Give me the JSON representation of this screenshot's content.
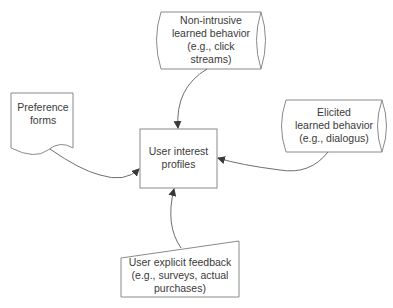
{
  "diagram": {
    "center": {
      "id": "user-interest-profiles",
      "shape": "rectangle",
      "lines": [
        "User interest",
        "profiles"
      ]
    },
    "sources": [
      {
        "id": "non-intrusive",
        "shape": "stored-data-cylinder",
        "lines": [
          "Non-intrusive",
          "learned behavior",
          "(e.g., click",
          "streams)"
        ],
        "position": "top"
      },
      {
        "id": "preference-forms",
        "shape": "document",
        "lines": [
          "Preference",
          "forms"
        ],
        "position": "left"
      },
      {
        "id": "elicited",
        "shape": "stored-data-cylinder",
        "lines": [
          "Elicited",
          "learned behavior",
          "(e.g., dialogus)"
        ],
        "position": "right"
      },
      {
        "id": "explicit-feedback",
        "shape": "manual-input",
        "lines": [
          "User explicit feedback",
          "(e.g., surveys, actual",
          "purchases)"
        ],
        "position": "bottom"
      }
    ],
    "edges": [
      {
        "from": "non-intrusive",
        "to": "user-interest-profiles"
      },
      {
        "from": "preference-forms",
        "to": "user-interest-profiles"
      },
      {
        "from": "elicited",
        "to": "user-interest-profiles"
      },
      {
        "from": "explicit-feedback",
        "to": "user-interest-profiles"
      }
    ],
    "colors": {
      "stroke": "#8a8a8a",
      "text": "#3a3a3a",
      "background": "#ffffff"
    }
  }
}
